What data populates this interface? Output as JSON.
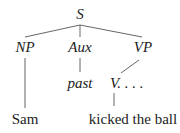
{
  "tree": {
    "root": {
      "label": "S"
    },
    "children": [
      {
        "label": "NP",
        "leaf": "Sam"
      },
      {
        "label": "Aux",
        "child": "past"
      },
      {
        "label": "VP",
        "child": "V. . . .",
        "leaf": "kicked the ball"
      }
    ]
  },
  "colors": {
    "text": "#222222",
    "lines": "#555555",
    "background": "#ffffff"
  }
}
